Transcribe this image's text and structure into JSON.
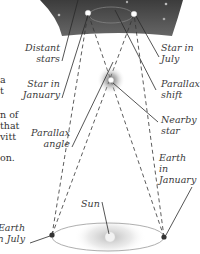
{
  "diagram": {
    "colors": {
      "sky_dark": "#3a3a3a",
      "sky_light": "#6e6e6e",
      "line": "#333333",
      "orbit": "#9a9a9a"
    },
    "labels": {
      "distant_stars": [
        "Distant",
        "stars"
      ],
      "star_in_july": [
        "Star in",
        "July"
      ],
      "star_in_january": [
        "Star in",
        "January"
      ],
      "parallax_shift": [
        "Parallax",
        "shift"
      ],
      "nearby_star": [
        "Nearby",
        "star"
      ],
      "parallax_angle": [
        "Parallax",
        "angle"
      ],
      "earth_in_january": [
        "Earth",
        "in",
        "January"
      ],
      "sun": "Sun",
      "earth_in_july": [
        "Earth",
        "in July"
      ]
    },
    "left_text_fragments": [
      "a",
      "t",
      "n of",
      "that",
      "vitt",
      "on."
    ]
  }
}
